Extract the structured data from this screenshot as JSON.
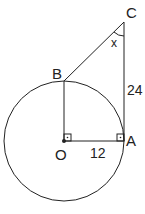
{
  "diagram": {
    "labels": {
      "C": "C",
      "B": "B",
      "A": "A",
      "O": "O",
      "angle": "x",
      "side_CA": "24",
      "side_OA": "12"
    },
    "colors": {
      "stroke": "#222222",
      "background": "#ffffff"
    }
  }
}
